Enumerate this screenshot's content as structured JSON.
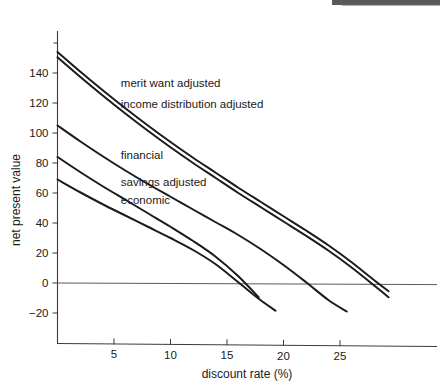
{
  "chart_data": {
    "type": "line",
    "title": "",
    "xlabel": "discount rate (%)",
    "ylabel": "net present value",
    "xlim": [
      0,
      30.2
    ],
    "ylim": [
      -28,
      168
    ],
    "xticks": [
      5,
      10,
      15,
      20,
      25
    ],
    "yticks": [
      -20,
      0,
      20,
      40,
      60,
      80,
      100,
      120,
      140
    ],
    "xtick_labels": [
      "5",
      "10",
      "15",
      "20",
      "25"
    ],
    "ytick_labels": [
      "−20",
      "0",
      "20",
      "40",
      "60",
      "80",
      "100",
      "120",
      "140"
    ],
    "grid": false,
    "legend": "inline-labels",
    "zero_line": true,
    "series": [
      {
        "name": "merit want adjusted",
        "label": "merit want adjusted",
        "label_x": 5.6,
        "label_y": 131,
        "x": [
          0,
          2,
          4,
          6,
          8,
          10,
          12,
          14,
          16,
          18,
          20,
          22,
          24,
          26,
          28,
          29.3
        ],
        "y": [
          154,
          141,
          128.5,
          116.5,
          105,
          94,
          83.5,
          73.5,
          63.5,
          54,
          44.5,
          35,
          25,
          14,
          2,
          -5.5
        ]
      },
      {
        "name": "income distribution adjusted",
        "label": "income distribution adjusted",
        "label_x": 5.6,
        "label_y": 117,
        "x": [
          0,
          2,
          4,
          6,
          8,
          10,
          12,
          14,
          16,
          18,
          20,
          22,
          24,
          26,
          28,
          29.3
        ],
        "y": [
          150.5,
          137.5,
          125,
          113,
          101.5,
          90.5,
          80,
          70,
          60,
          50.5,
          41,
          31.5,
          21.5,
          10.5,
          -1.5,
          -9.5
        ]
      },
      {
        "name": "financial",
        "label": "financial",
        "label_x": 5.6,
        "label_y": 82.5,
        "x": [
          0,
          2,
          4,
          6,
          8,
          10,
          12,
          14,
          16,
          18,
          20,
          22,
          24,
          25.6
        ],
        "y": [
          105,
          94.5,
          84.5,
          75,
          66,
          57.5,
          49,
          40.5,
          32,
          22.5,
          12,
          0.5,
          -11.5,
          -19
        ]
      },
      {
        "name": "savings adjusted",
        "label": "savings adjusted",
        "label_x": 5.6,
        "label_y": 65,
        "x": [
          0,
          2,
          4,
          6,
          8,
          10,
          12,
          14,
          16,
          17.8
        ],
        "y": [
          84,
          74,
          64.5,
          55.5,
          46.5,
          37.5,
          28,
          17.5,
          4.5,
          -9.5
        ]
      },
      {
        "name": "economic",
        "label": "economic",
        "label_x": 5.6,
        "label_y": 53,
        "x": [
          0,
          2,
          4,
          6,
          8,
          10,
          12,
          14,
          16,
          17.9,
          19.3
        ],
        "y": [
          69,
          60.5,
          52.5,
          45,
          37.5,
          30,
          22,
          12.5,
          0.5,
          -11,
          -18.5
        ]
      }
    ]
  },
  "axes": {
    "x_axis_title": "discount rate (%)",
    "y_axis_title": "net present value"
  },
  "labels": {
    "merit_want_adjusted": "merit want adjusted",
    "income_distribution_adjusted": "income distribution adjusted",
    "financial": "financial",
    "savings_adjusted": "savings adjusted",
    "economic": "economic"
  },
  "colors": {
    "curve": "#1b1b1b",
    "axis": "#3a3a3a",
    "zero_line": "#5a5a5a",
    "text": "#1a1a1a",
    "background": "#ffffff"
  }
}
